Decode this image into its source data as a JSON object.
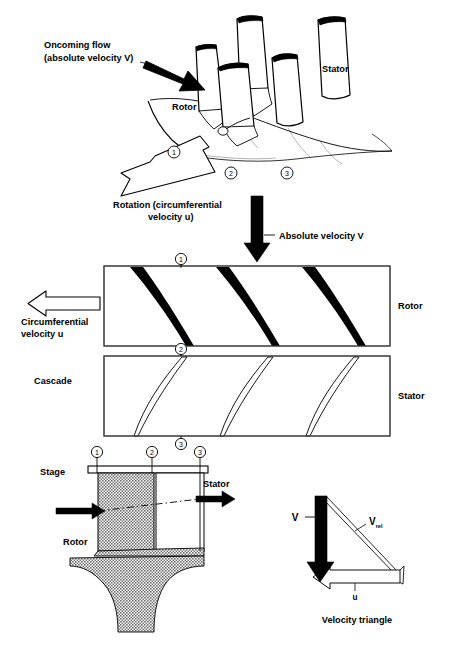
{
  "figure": {
    "title_implicit": "Turbomachinery stage: rotor and stator blade rows",
    "background_color": "#ffffff",
    "ink_color": "#000000",
    "hatch_color": "#808080"
  },
  "perspective_view": {
    "name": "three-dimensional blade row view",
    "labels": {
      "oncoming_flow_line1": "Oncoming flow",
      "oncoming_flow_line2": "(absolute velocity V)",
      "rotor": "Rotor",
      "stator": "Stator",
      "rotation_line1": "Rotation (circumferential",
      "rotation_line2": "velocity u)"
    },
    "stations": [
      "1",
      "2",
      "3"
    ],
    "arrows": {
      "oncoming_flow": "solid-black-arrow-down-right",
      "rotation": "hollow-white-arrow-down-left"
    }
  },
  "cascade_view": {
    "name": "two-dimensional cascade view",
    "labels": {
      "cascade": "Cascade",
      "rotor": "Rotor",
      "stator": "Stator",
      "absolute_velocity": "Absolute velocity V",
      "circumferential_line1": "Circumferential",
      "circumferential_line2": "velocity u"
    },
    "stations": [
      "1",
      "2",
      "3"
    ],
    "rotor_blade_count": 3,
    "stator_blade_count": 3,
    "rotor_blade_style": "solid-black-cambered",
    "stator_blade_style": "thin-outline-cambered",
    "arrows": {
      "absolute_velocity": "solid-black-arrow-down",
      "circumferential_velocity": "hollow-white-arrow-left"
    }
  },
  "stage_view": {
    "name": "meridional stage cross-section",
    "labels": {
      "stage": "Stage",
      "rotor": "Rotor",
      "stator": "Stator"
    },
    "stations": [
      "1",
      "2",
      "3"
    ],
    "arrows": {
      "inlet": "solid-black-arrow-right",
      "outlet": "solid-black-arrow-right",
      "streamline": "dashed-centerline"
    }
  },
  "velocity_triangle": {
    "name": "velocity triangle",
    "caption": "Velocity triangle",
    "vectors": [
      {
        "symbol": "V",
        "subscript": "",
        "style": "solid-black-arrow-down",
        "meaning": "absolute velocity"
      },
      {
        "symbol": "V",
        "subscript": "rel",
        "style": "thin-outline-arrow",
        "meaning": "relative velocity"
      },
      {
        "symbol": "u",
        "subscript": "",
        "style": "hollow-white-arrow-left",
        "meaning": "circumferential velocity"
      }
    ]
  }
}
